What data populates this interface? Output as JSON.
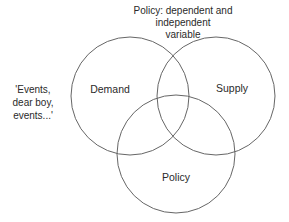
{
  "diagram": {
    "type": "venn",
    "title_lines": [
      "Policy: dependent and independent",
      "variable"
    ],
    "side_note_lines": [
      "'Events,",
      "dear boy,",
      "events...'"
    ],
    "stroke_color": "#666666",
    "text_color": "#2a2a2a",
    "sets": [
      {
        "id": "demand",
        "label": "Demand",
        "cx": 130,
        "cy": 96,
        "r": 59,
        "label_x": 110,
        "label_y": 89
      },
      {
        "id": "supply",
        "label": "Supply",
        "cx": 216,
        "cy": 96,
        "r": 59,
        "label_x": 232,
        "label_y": 88
      },
      {
        "id": "policy",
        "label": "Policy",
        "cx": 176,
        "cy": 154,
        "r": 59,
        "label_x": 176,
        "label_y": 177
      }
    ]
  }
}
